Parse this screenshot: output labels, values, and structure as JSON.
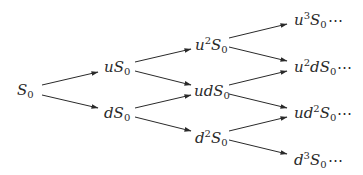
{
  "diagram": {
    "type": "binomial-tree",
    "color": "#2a2a2a",
    "nodes": [
      {
        "id": "s0",
        "base": "S",
        "prefix": "",
        "sup": "",
        "mid": "",
        "sub": "0",
        "suffix": "",
        "x": 17,
        "y": 91,
        "level": 0
      },
      {
        "id": "us0",
        "base": "S",
        "prefix": "u",
        "sup": "",
        "mid": "",
        "sub": "0",
        "suffix": "",
        "x": 104,
        "y": 68,
        "level": 1
      },
      {
        "id": "ds0",
        "base": "S",
        "prefix": "d",
        "sup": "",
        "mid": "",
        "sub": "0",
        "suffix": "",
        "x": 104,
        "y": 114,
        "level": 1
      },
      {
        "id": "u2s0",
        "base": "S",
        "prefix": "u",
        "sup": "2",
        "mid": "",
        "sub": "0",
        "suffix": "",
        "x": 195,
        "y": 45,
        "level": 2
      },
      {
        "id": "uds0",
        "base": "S",
        "prefix": "ud",
        "sup": "",
        "mid": "",
        "sub": "0",
        "suffix": "",
        "x": 194,
        "y": 92,
        "level": 2
      },
      {
        "id": "d2s0",
        "base": "S",
        "prefix": "d",
        "sup": "2",
        "mid": "",
        "sub": "0",
        "suffix": "",
        "x": 195,
        "y": 138,
        "level": 2
      },
      {
        "id": "u3s0",
        "base": "S",
        "prefix": "u",
        "sup": "3",
        "mid": "",
        "sub": "0",
        "suffix": "⋯",
        "x": 294,
        "y": 20,
        "level": 3
      },
      {
        "id": "u2ds0",
        "base": "S",
        "prefix": "u",
        "sup": "2",
        "mid": "d",
        "sub": "0",
        "suffix": "⋯",
        "x": 294,
        "y": 67,
        "level": 3
      },
      {
        "id": "ud2s0",
        "base": "S",
        "prefix": "ud",
        "sup": "2",
        "mid": "",
        "sub": "0",
        "suffix": "⋯",
        "x": 294,
        "y": 113,
        "level": 3
      },
      {
        "id": "d3s0",
        "base": "S",
        "prefix": "d",
        "sup": "3",
        "mid": "",
        "sub": "0",
        "suffix": "⋯",
        "x": 294,
        "y": 160,
        "level": 3
      }
    ],
    "labels": {
      "s0": "S0",
      "us0": "uS0",
      "ds0": "dS0",
      "u2s0": "u^2 S0",
      "uds0": "udS0",
      "d2s0": "d^2 S0",
      "u3s0": "u^3 S0 ⋯",
      "u2ds0": "u^2 d S0 ⋯",
      "ud2s0": "u d^2 S0 ⋯",
      "d3s0": "d^3 S0 ⋯"
    },
    "edges": [
      {
        "from": "s0",
        "to": "us0",
        "x1": 42,
        "y1": 85,
        "x2": 98,
        "y2": 72
      },
      {
        "from": "s0",
        "to": "ds0",
        "x1": 42,
        "y1": 95,
        "x2": 98,
        "y2": 108
      },
      {
        "from": "us0",
        "to": "u2s0",
        "x1": 135,
        "y1": 62,
        "x2": 191,
        "y2": 49
      },
      {
        "from": "us0",
        "to": "uds0",
        "x1": 135,
        "y1": 71,
        "x2": 191,
        "y2": 85
      },
      {
        "from": "ds0",
        "to": "uds0",
        "x1": 135,
        "y1": 108,
        "x2": 191,
        "y2": 95
      },
      {
        "from": "ds0",
        "to": "d2s0",
        "x1": 135,
        "y1": 117,
        "x2": 191,
        "y2": 131
      },
      {
        "from": "u2s0",
        "to": "u3s0",
        "x1": 229,
        "y1": 38,
        "x2": 287,
        "y2": 24
      },
      {
        "from": "u2s0",
        "to": "u2ds0",
        "x1": 229,
        "y1": 47,
        "x2": 287,
        "y2": 61
      },
      {
        "from": "uds0",
        "to": "u2ds0",
        "x1": 229,
        "y1": 85,
        "x2": 287,
        "y2": 71
      },
      {
        "from": "uds0",
        "to": "ud2s0",
        "x1": 229,
        "y1": 94,
        "x2": 287,
        "y2": 108
      },
      {
        "from": "d2s0",
        "to": "ud2s0",
        "x1": 229,
        "y1": 131,
        "x2": 287,
        "y2": 117
      },
      {
        "from": "d2s0",
        "to": "d3s0",
        "x1": 229,
        "y1": 140,
        "x2": 287,
        "y2": 154
      }
    ]
  }
}
